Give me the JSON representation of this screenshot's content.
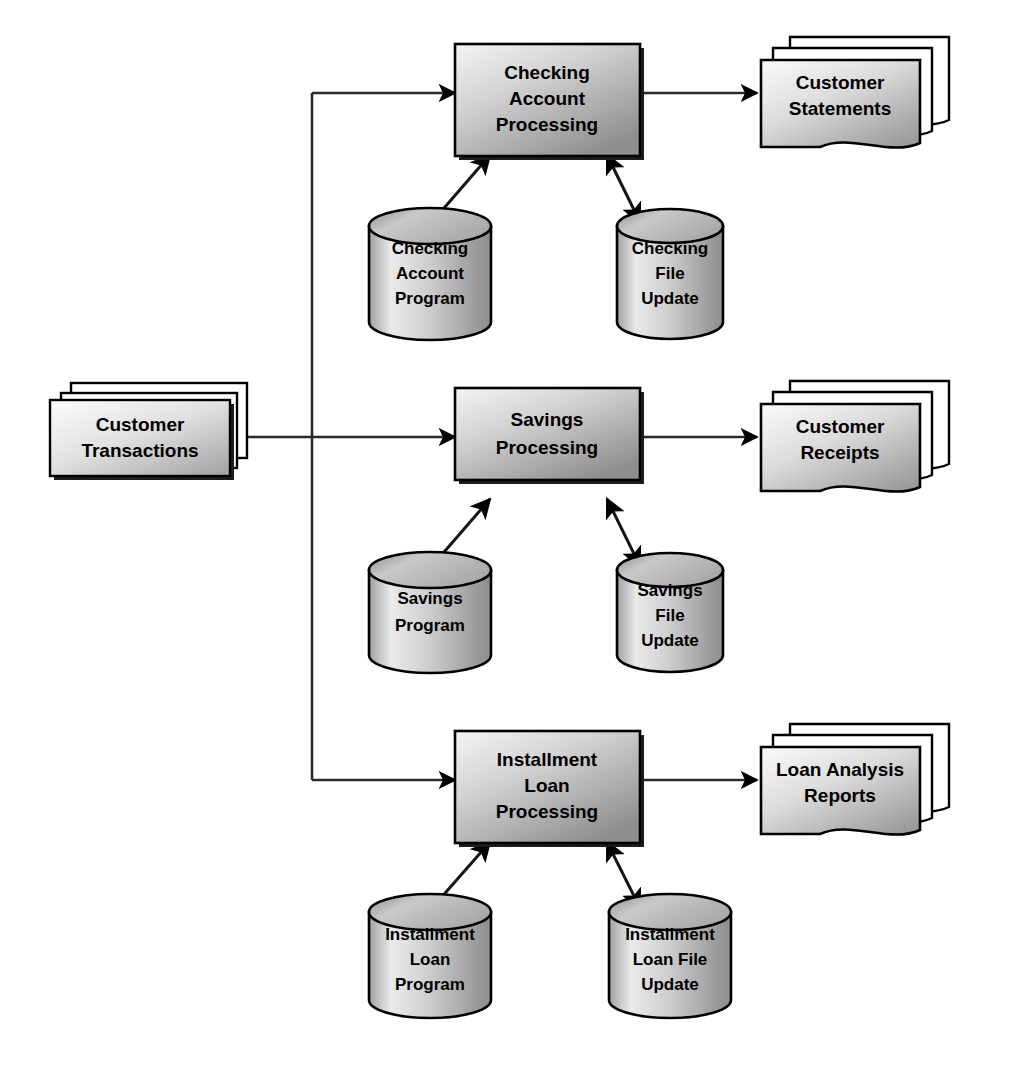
{
  "diagram": {
    "colors": {
      "background": "#ffffff",
      "stroke": "#000000",
      "process_fill_light": "#f2f2f2",
      "process_fill_dark": "#949494",
      "store_fill_light": "#f0f0f0",
      "store_fill_dark": "#8f8f8f",
      "doc_fill_light": "#fafafa",
      "doc_fill_dark": "#9a9a9a",
      "shadow": "#1a1a1a"
    },
    "input": {
      "id": "customer-transactions",
      "shape": "stacked-card",
      "label_lines": [
        "Customer",
        "Transactions"
      ]
    },
    "rows": [
      {
        "id": "checking",
        "process": {
          "shape": "process-box",
          "label_lines": [
            "Checking",
            "Account",
            "Processing"
          ]
        },
        "program_store": {
          "shape": "cylinder",
          "label_lines": [
            "Checking",
            "Account",
            "Program"
          ]
        },
        "file_store": {
          "shape": "cylinder",
          "label_lines": [
            "Checking",
            "File",
            "Update"
          ]
        },
        "output": {
          "shape": "stacked-document",
          "label_lines": [
            "Customer",
            "Statements"
          ]
        }
      },
      {
        "id": "savings",
        "process": {
          "shape": "process-box",
          "label_lines": [
            "Savings",
            "Processing"
          ]
        },
        "program_store": {
          "shape": "cylinder",
          "label_lines": [
            "Savings",
            "Program"
          ]
        },
        "file_store": {
          "shape": "cylinder",
          "label_lines": [
            "Savings",
            "File",
            "Update"
          ]
        },
        "output": {
          "shape": "stacked-document",
          "label_lines": [
            "Customer",
            "Receipts"
          ]
        }
      },
      {
        "id": "installment-loan",
        "process": {
          "shape": "process-box",
          "label_lines": [
            "Installment",
            "Loan",
            "Processing"
          ]
        },
        "program_store": {
          "shape": "cylinder",
          "label_lines": [
            "Installment",
            "Loan",
            "Program"
          ]
        },
        "file_store": {
          "shape": "cylinder",
          "label_lines": [
            "Installment",
            "Loan File",
            "Update"
          ]
        },
        "output": {
          "shape": "stacked-document",
          "label_lines": [
            "Loan Analysis",
            "Reports"
          ]
        }
      }
    ],
    "connectors": [
      {
        "id": "input-to-bus",
        "kind": "line",
        "arrow": "none"
      },
      {
        "id": "bus-to-checking",
        "kind": "elbow",
        "arrow": "end"
      },
      {
        "id": "bus-to-savings",
        "kind": "line",
        "arrow": "end"
      },
      {
        "id": "bus-to-loan",
        "kind": "elbow",
        "arrow": "end"
      },
      {
        "id": "checking-to-statements",
        "kind": "line",
        "arrow": "end"
      },
      {
        "id": "savings-to-receipts",
        "kind": "line",
        "arrow": "end"
      },
      {
        "id": "loan-to-reports",
        "kind": "line",
        "arrow": "end"
      },
      {
        "id": "checking-program-to-process",
        "kind": "line",
        "arrow": "end"
      },
      {
        "id": "savings-program-to-process",
        "kind": "line",
        "arrow": "end"
      },
      {
        "id": "loan-program-to-process",
        "kind": "line",
        "arrow": "end"
      },
      {
        "id": "checking-process-to-file",
        "kind": "line",
        "arrow": "both"
      },
      {
        "id": "savings-process-to-file",
        "kind": "line",
        "arrow": "both"
      },
      {
        "id": "loan-process-to-file",
        "kind": "line",
        "arrow": "both"
      }
    ]
  }
}
